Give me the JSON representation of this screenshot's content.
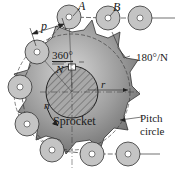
{
  "figure": {
    "labels": {
      "pitch": "p",
      "roller_a": "A",
      "roller_b": "B",
      "angle_full_num": "360°",
      "angle_full_den": "N",
      "angle_half": "180°/N",
      "speed": "n",
      "radius": "r",
      "sprocket": "Sprocket",
      "pitch_circle_line1": "Pitch",
      "pitch_circle_line2": "circle"
    },
    "colors": {
      "sprocket_fill": "#8a8a8a",
      "sprocket_light": "#c8c8c8",
      "roller_fill": "#c4c4c4",
      "hub_fill": "#9a9a9a",
      "line": "#2a2a2a"
    },
    "sprocket": {
      "center": [
        72,
        92
      ],
      "teeth": 11,
      "hub_radius": 26
    },
    "rollers": [
      {
        "name": "roller-a",
        "x": 69,
        "y": 17
      },
      {
        "name": "roller-b",
        "x": 108,
        "y": 18
      },
      {
        "name": "roller-free-top",
        "x": 140,
        "y": 18
      },
      {
        "name": "roller-left-1",
        "x": 37,
        "y": 52
      },
      {
        "name": "roller-left-2",
        "x": 20,
        "y": 87
      },
      {
        "name": "roller-left-3",
        "x": 27,
        "y": 124
      },
      {
        "name": "roller-bottom-1",
        "x": 52,
        "y": 150
      },
      {
        "name": "roller-bottom-2",
        "x": 92,
        "y": 154
      },
      {
        "name": "roller-free-bottom",
        "x": 128,
        "y": 154
      }
    ]
  }
}
